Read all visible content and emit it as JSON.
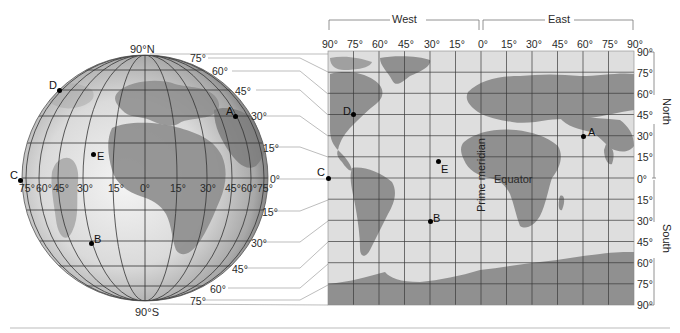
{
  "globe": {
    "north_pole_label": "90°N",
    "south_pole_label": "90°S",
    "latitude_labels_right": [
      "75°",
      "60°",
      "45°",
      "30°",
      "15°",
      "0°",
      "15°",
      "30°",
      "45°",
      "60°",
      "75°"
    ],
    "longitude_labels": [
      "75°",
      "60°",
      "45°",
      "30°",
      "15°",
      "0°",
      "15°",
      "30°",
      "45°",
      "60°",
      "75°"
    ],
    "points": [
      {
        "id": "A",
        "label": "A"
      },
      {
        "id": "B",
        "label": "B"
      },
      {
        "id": "C",
        "label": "C"
      },
      {
        "id": "D",
        "label": "D"
      },
      {
        "id": "E",
        "label": "E"
      }
    ]
  },
  "map": {
    "west_label": "West",
    "east_label": "East",
    "longitude_labels": [
      "90°",
      "75°",
      "60°",
      "45°",
      "30°",
      "15°",
      "0°",
      "15°",
      "30°",
      "45°",
      "60°",
      "75°",
      "90°"
    ],
    "latitude_labels": [
      "90°",
      "75°",
      "60°",
      "45°",
      "30°",
      "15°",
      "0°",
      "15°",
      "30°",
      "45°",
      "60°",
      "75°",
      "90°"
    ],
    "north_label": "North",
    "south_label": "South",
    "equator_label": "Equator",
    "prime_meridian_label": "Prime meridian",
    "points": [
      {
        "id": "A",
        "label": "A",
        "lon": 60,
        "lat": 30
      },
      {
        "id": "B",
        "label": "B",
        "lon": -30,
        "lat": -30
      },
      {
        "id": "C",
        "label": "C",
        "lon": -90,
        "lat": 0
      },
      {
        "id": "D",
        "label": "D",
        "lon": -75,
        "lat": 45
      },
      {
        "id": "E",
        "label": "E",
        "lon": -25,
        "lat": 15
      }
    ]
  },
  "colors": {
    "land": "#8f8f8f",
    "ocean": "#dcdcdc",
    "grid": "#3a3a3a",
    "leader_lines": "#9a9a9a"
  }
}
